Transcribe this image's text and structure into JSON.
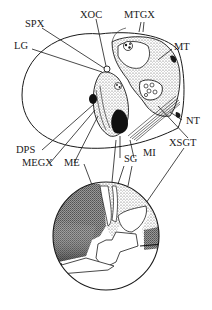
{
  "figure": {
    "type": "anatomical-diagram",
    "colors": {
      "line": "#1a1a1a",
      "background": "#ffffff",
      "dark": "#111111",
      "stipple": "#8a8a8a"
    }
  },
  "labels": {
    "spx": "SPX",
    "xoc": "XOC",
    "mtgx": "MTGX",
    "lg": "LG",
    "mt": "MT",
    "nt": "NT",
    "dps": "DPS",
    "megx": "MEGX",
    "me": "ME",
    "sg": "SG",
    "mi": "MI",
    "xsgt": "XSGT"
  }
}
